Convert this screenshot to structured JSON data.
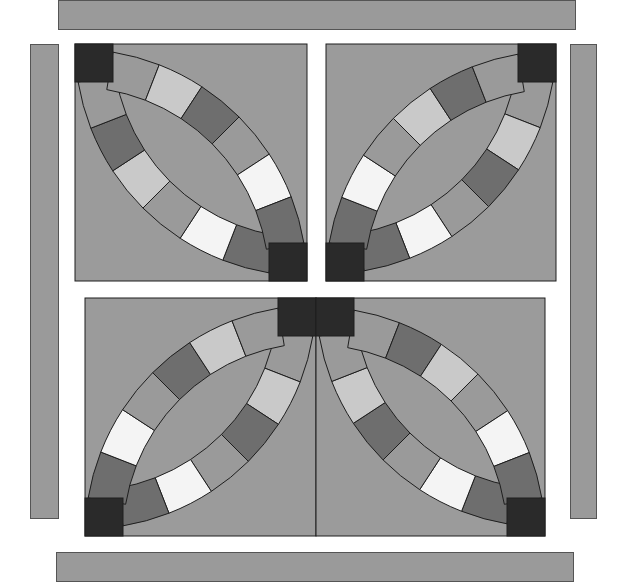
{
  "palette": {
    "background": "#9b9b9b",
    "dark": "#2a2a2a",
    "medium_dark": "#6e6e6e",
    "medium": "#9a9a9a",
    "light": "#c9c9c9",
    "white": "#f4f4f4",
    "outline": "#1e1e1e",
    "strip": "#9a9a9a"
  },
  "blocks": [
    {
      "name": "top-left",
      "arc_corners": [
        "top-left",
        "bottom-right"
      ],
      "outer_arc_a": [
        "medium_dark",
        "white",
        "medium",
        "light",
        "medium_dark",
        "medium"
      ],
      "outer_arc_b": [
        "medium",
        "light",
        "medium_dark",
        "medium",
        "white",
        "medium_dark"
      ]
    },
    {
      "name": "top-right",
      "arc_corners": [
        "top-right",
        "bottom-left"
      ],
      "outer_arc_a": [
        "medium",
        "light",
        "medium_dark",
        "medium",
        "white",
        "medium_dark"
      ],
      "outer_arc_b": [
        "medium_dark",
        "white",
        "medium",
        "light",
        "medium_dark",
        "medium"
      ]
    },
    {
      "name": "bottom-left",
      "arc_corners": [
        "top-right",
        "bottom-left"
      ],
      "outer_arc_a": [
        "medium",
        "light",
        "medium_dark",
        "medium",
        "white",
        "medium_dark"
      ],
      "outer_arc_b": [
        "medium_dark",
        "white",
        "medium",
        "medium_dark",
        "light",
        "medium"
      ]
    },
    {
      "name": "bottom-right",
      "arc_corners": [
        "top-left",
        "bottom-right"
      ],
      "outer_arc_a": [
        "medium_dark",
        "white",
        "medium",
        "medium_dark",
        "light",
        "medium"
      ],
      "outer_arc_b": [
        "medium",
        "medium_dark",
        "light",
        "medium",
        "white",
        "medium_dark"
      ]
    }
  ]
}
